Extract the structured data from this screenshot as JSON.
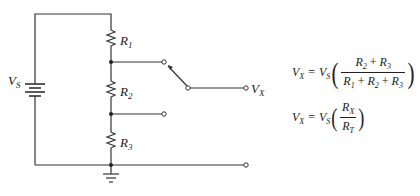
{
  "diagram": {
    "type": "voltage-divider-circuit",
    "source": {
      "label": "V",
      "subscript": "S"
    },
    "resistors": [
      {
        "label": "R",
        "subscript": "1"
      },
      {
        "label": "R",
        "subscript": "2"
      },
      {
        "label": "R",
        "subscript": "3"
      }
    ],
    "output": {
      "label": "V",
      "subscript": "X"
    },
    "ground": "ground-symbol",
    "switch": {
      "positions": 2,
      "selected": "top"
    }
  },
  "equations": {
    "eq1": {
      "lhs_v": "V",
      "lhs_sub": "X",
      "equals": "=",
      "rhs_v": "V",
      "rhs_sub": "S",
      "num": [
        {
          "v": "R",
          "s": "2"
        },
        {
          "op": " + "
        },
        {
          "v": "R",
          "s": "3"
        }
      ],
      "den": [
        {
          "v": "R",
          "s": "1"
        },
        {
          "op": " + "
        },
        {
          "v": "R",
          "s": "2"
        },
        {
          "op": " + "
        },
        {
          "v": "R",
          "s": "3"
        }
      ]
    },
    "eq2": {
      "lhs_v": "V",
      "lhs_sub": "X",
      "equals": "=",
      "rhs_v": "V",
      "rhs_sub": "S",
      "num_v": "R",
      "num_sub": "X",
      "den_v": "R",
      "den_sub": "T"
    },
    "paren_open": "(",
    "paren_close": ")"
  }
}
